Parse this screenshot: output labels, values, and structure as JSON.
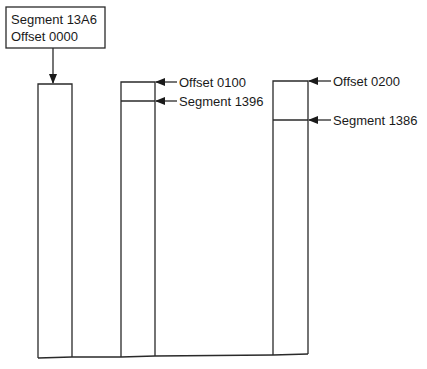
{
  "diagram": {
    "callout": {
      "line1": "Segment 13A6",
      "line2": "Offset 0000"
    },
    "labels": {
      "box2_offset": "Offset 0100",
      "box2_segment": "Segment 1396",
      "box3_offset": "Offset 0200",
      "box3_segment": "Segment 1386"
    },
    "colors": {
      "line": "#2a2a2a",
      "text": "#1a1a1a",
      "background": "#ffffff"
    }
  }
}
